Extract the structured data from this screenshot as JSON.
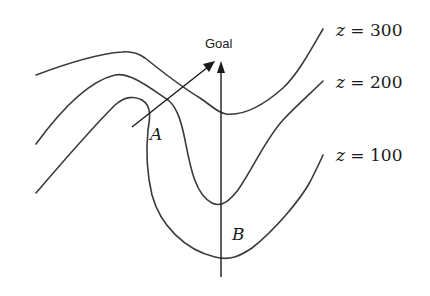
{
  "diagram": {
    "goal_label": "Goal",
    "points": [
      {
        "id": "A",
        "label": "A"
      },
      {
        "id": "B",
        "label": "B"
      }
    ],
    "contours": [
      {
        "level": 300,
        "var": "z",
        "eq": " = ",
        "value": "300"
      },
      {
        "level": 200,
        "var": "z",
        "eq": " = ",
        "value": "200"
      },
      {
        "level": 100,
        "var": "z",
        "eq": " = ",
        "value": "100"
      }
    ],
    "colors": {
      "line": "#3a3a3a",
      "text": "#1a1a1a",
      "background": "#ffffff"
    }
  }
}
